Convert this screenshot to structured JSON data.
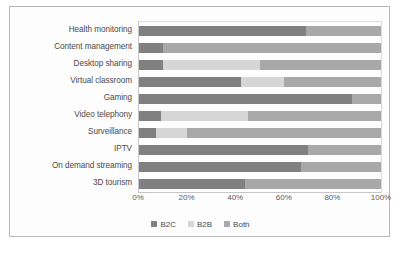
{
  "chart_data": {
    "type": "bar",
    "subtype": "horizontal-100-percent-stacked",
    "title": "",
    "xlabel": "",
    "ylabel": "",
    "xlim": [
      0,
      100
    ],
    "xticks": [
      "0%",
      "20%",
      "40%",
      "60%",
      "80%",
      "100%"
    ],
    "xtick_values": [
      0,
      20,
      40,
      60,
      80,
      100
    ],
    "grid": false,
    "legend_position": "bottom-center",
    "categories": [
      "Health monitoring",
      "Content management",
      "Desktop sharing",
      "Virtual classroom",
      "Gaming",
      "Video telephony",
      "Surveillance",
      "IPTV",
      "On demand streaming",
      "3D tourism"
    ],
    "series": [
      {
        "name": "B2C",
        "color": "#808080",
        "values": [
          69,
          10,
          10,
          42,
          88,
          9,
          7,
          70,
          67,
          44
        ]
      },
      {
        "name": "B2B",
        "color": "#d6d6d6",
        "values": [
          0,
          0,
          40,
          18,
          0,
          36,
          13,
          0,
          0,
          0
        ]
      },
      {
        "name": "Both",
        "color": "#a8a8a8",
        "values": [
          31,
          90,
          50,
          40,
          12,
          55,
          80,
          30,
          33,
          56
        ]
      }
    ]
  }
}
